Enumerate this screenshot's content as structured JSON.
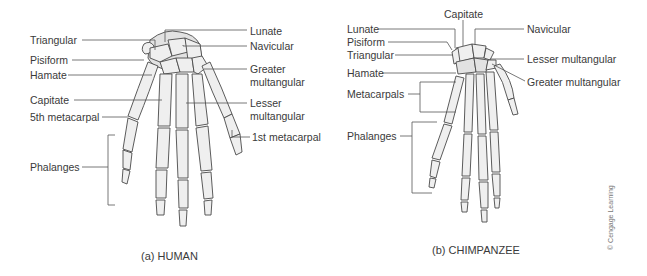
{
  "figure": {
    "panels": [
      {
        "caption": "(a) HUMAN",
        "labels": {
          "triangular": "Triangular",
          "pisiform": "Pisiform",
          "hamate": "Hamate",
          "capitate": "Capitate",
          "fifth_metacarpal": "5th metacarpal",
          "phalanges": "Phalanges",
          "lunate": "Lunate",
          "navicular": "Navicular",
          "greater_multangular_1": "Greater",
          "greater_multangular_2": "multangular",
          "lesser_multangular_1": "Lesser",
          "lesser_multangular_2": "multangular",
          "first_metacarpal": "1st metacarpal"
        }
      },
      {
        "caption": "(b) CHIMPANZEE",
        "labels": {
          "capitate": "Capitate",
          "lunate": "Lunate",
          "pisiform": "Pisiform",
          "triangular": "Triangular",
          "hamate": "Hamate",
          "metacarpals": "Metacarpals",
          "phalanges": "Phalanges",
          "navicular": "Navicular",
          "lesser_multangular": "Lesser multangular",
          "greater_multangular": "Greater multangular"
        }
      }
    ],
    "credit": "© Cengage Learning"
  }
}
